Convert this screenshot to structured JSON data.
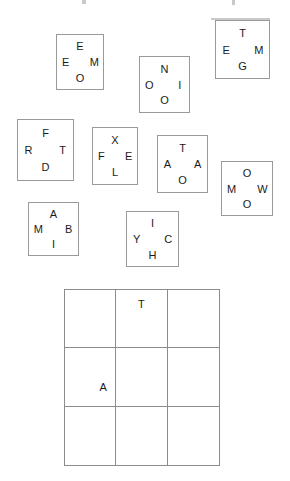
{
  "canvas": {
    "width": 290,
    "height": 481,
    "background": "#ffffff"
  },
  "style": {
    "card_border_color": "#9a9a9a",
    "grid_border_color": "#8c8c8c",
    "text_color": "#1b1b1b"
  },
  "cards": [
    {
      "id": "card-1",
      "x": 56,
      "y": 34,
      "w": 48,
      "h": 56,
      "top": "E",
      "left": "E",
      "right": "M",
      "bottom": "O"
    },
    {
      "id": "card-2",
      "x": 139,
      "y": 56,
      "w": 51,
      "h": 57,
      "top": "N",
      "left": "O",
      "right": "I",
      "bottom": "O"
    },
    {
      "id": "card-3",
      "x": 215,
      "y": 20,
      "w": 55,
      "h": 59,
      "top": "T",
      "left": "E",
      "right": "M",
      "bottom": "G"
    },
    {
      "id": "card-4",
      "x": 17,
      "y": 119,
      "w": 57,
      "h": 62,
      "top": "F",
      "left": "R",
      "right": "T",
      "bottom": "D"
    },
    {
      "id": "card-5",
      "x": 92,
      "y": 127,
      "w": 46,
      "h": 58,
      "top": "X",
      "left": "F",
      "right": "E",
      "bottom": "L"
    },
    {
      "id": "card-6",
      "x": 157,
      "y": 135,
      "w": 51,
      "h": 58,
      "top": "T",
      "left": "A",
      "right": "A",
      "bottom": "O"
    },
    {
      "id": "card-7",
      "x": 221,
      "y": 161,
      "w": 52,
      "h": 55,
      "top": "O",
      "left": "M",
      "right": "W",
      "bottom": "O"
    },
    {
      "id": "card-8",
      "x": 28,
      "y": 202,
      "w": 51,
      "h": 54,
      "top": "A",
      "left": "M",
      "right": "B",
      "bottom": "I"
    },
    {
      "id": "card-9",
      "x": 126,
      "y": 211,
      "w": 53,
      "h": 56,
      "top": "I",
      "left": "Y",
      "right": "C",
      "bottom": "H"
    }
  ],
  "grid": {
    "x": 64,
    "y": 289,
    "w": 156,
    "h": 177,
    "rows": 3,
    "columns": 3,
    "cells": [
      [
        {
          "letter": "",
          "position": "empty"
        },
        {
          "letter": "T",
          "position": "pos-top-center"
        },
        {
          "letter": "",
          "position": "empty"
        }
      ],
      [
        {
          "letter": "A",
          "position": "pos-mid-right"
        },
        {
          "letter": "",
          "position": "empty"
        },
        {
          "letter": "",
          "position": "empty"
        }
      ],
      [
        {
          "letter": "",
          "position": "empty"
        },
        {
          "letter": "",
          "position": "empty"
        },
        {
          "letter": "",
          "position": "empty"
        }
      ]
    ]
  },
  "artifacts": [
    {
      "x": 82,
      "y": 0,
      "w": 4,
      "h": 4
    },
    {
      "x": 232,
      "y": 0,
      "w": 3,
      "h": 5
    },
    {
      "x": 211,
      "y": 18,
      "w": 59,
      "h": 2
    }
  ]
}
